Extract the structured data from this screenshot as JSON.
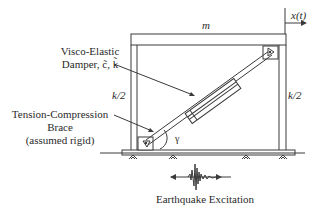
{
  "diagram": {
    "type": "structural-frame-schematic",
    "colors": {
      "line": "#3a3a3a",
      "fill": "#ffffff",
      "text": "#2a2a2a"
    },
    "mass_label": "m",
    "displacement_label": "x(t)",
    "left_stiffness_label": "k/2",
    "right_stiffness_label": "k/2",
    "damper_label_line1": "Visco-Elastic",
    "damper_label_line2": "Damper, c̃, k̃",
    "brace_label_line1": "Tension-Compression",
    "brace_label_line2": "Brace",
    "brace_label_line3": "(assumed rigid)",
    "angle_label": "γ",
    "excitation_label": "Earthquake Excitation"
  }
}
